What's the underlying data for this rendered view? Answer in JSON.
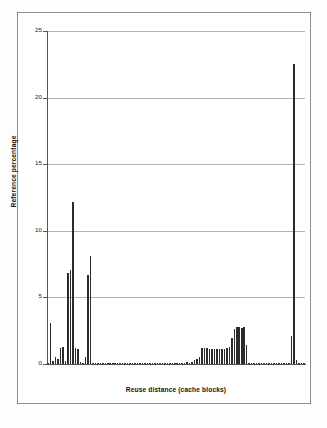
{
  "chart_data": {
    "type": "bar",
    "title": "",
    "xlabel": "Reuse distance (cache blocks)",
    "ylabel": "Reference percentage",
    "ylim": [
      0,
      25
    ],
    "yticks": [
      0,
      5,
      10,
      15,
      20,
      25
    ],
    "ytick_labels": [
      "0",
      "5",
      "10",
      "15",
      "20",
      "25"
    ],
    "xticks": [],
    "xtick_labels": [],
    "grid": true,
    "legend": false,
    "bar_color": "#2b2b2b",
    "categories": [
      "1",
      "2",
      "3",
      "4",
      "5",
      "6",
      "7",
      "8",
      "9",
      "10",
      "11",
      "12",
      "13",
      "14",
      "15",
      "16",
      "17",
      "18",
      "19",
      "20",
      "21",
      "22",
      "23",
      "24",
      "25",
      "26",
      "27",
      "28",
      "29",
      "30",
      "31",
      "32",
      "33",
      "34",
      "35",
      "36",
      "37",
      "38",
      "39",
      "40",
      "41",
      "42",
      "43",
      "44",
      "45",
      "46",
      "47",
      "48",
      "49",
      "50",
      "51",
      "52",
      "53",
      "54",
      "55",
      "56",
      "57",
      "58",
      "59",
      "60",
      "61",
      "62",
      "63",
      "64",
      "65",
      "66",
      "67",
      "68",
      "69",
      "70",
      "71",
      "72",
      "73",
      "74",
      "75",
      "76",
      "77",
      "78",
      "79",
      "80",
      "81",
      "82",
      "83",
      "84",
      "85",
      "86",
      "87",
      "88",
      "89",
      "90",
      "91",
      "92",
      "93",
      "94",
      "95",
      "96",
      "97",
      "98",
      "99",
      "100",
      "101",
      "102",
      "103",
      "104"
    ],
    "values": [
      0.1,
      3.1,
      0.2,
      0.55,
      0.35,
      1.2,
      1.25,
      0.2,
      6.8,
      7.05,
      12.2,
      1.2,
      1.15,
      0.15,
      0.1,
      0.55,
      6.7,
      8.1,
      0.05,
      0.05,
      0.05,
      0.05,
      0.05,
      0.05,
      0.05,
      0.05,
      0.05,
      0.05,
      0.05,
      0.05,
      0.05,
      0.05,
      0.05,
      0.05,
      0.05,
      0.05,
      0.05,
      0.05,
      0.05,
      0.05,
      0.05,
      0.05,
      0.05,
      0.05,
      0.05,
      0.05,
      0.05,
      0.05,
      0.05,
      0.05,
      0.05,
      0.05,
      0.05,
      0.05,
      0.05,
      0.1,
      0.15,
      0.1,
      0.15,
      0.3,
      0.4,
      0.55,
      1.2,
      1.2,
      1.2,
      1.15,
      1.15,
      1.15,
      1.15,
      1.15,
      1.15,
      1.15,
      1.2,
      1.25,
      1.95,
      2.65,
      2.75,
      2.75,
      2.7,
      2.75,
      1.4,
      0.05,
      0.05,
      0.05,
      0.05,
      0.05,
      0.05,
      0.05,
      0.05,
      0.05,
      0.05,
      0.05,
      0.05,
      0.05,
      0.05,
      0.05,
      0.05,
      0.05,
      2.1,
      22.5,
      0.3,
      0.05,
      0.05,
      0.05
    ]
  },
  "axes": {
    "y_title": "Reference percentage",
    "x_title": "Reuse distance (cache blocks)",
    "y_labels": [
      "25",
      "20",
      "15",
      "10",
      "5",
      "0"
    ]
  },
  "colors": {
    "bar": "#2b2b2b",
    "grid": "#b4b4b4",
    "axis": "#555555",
    "frame": "#8d8d8d",
    "background": "#ffffff"
  }
}
